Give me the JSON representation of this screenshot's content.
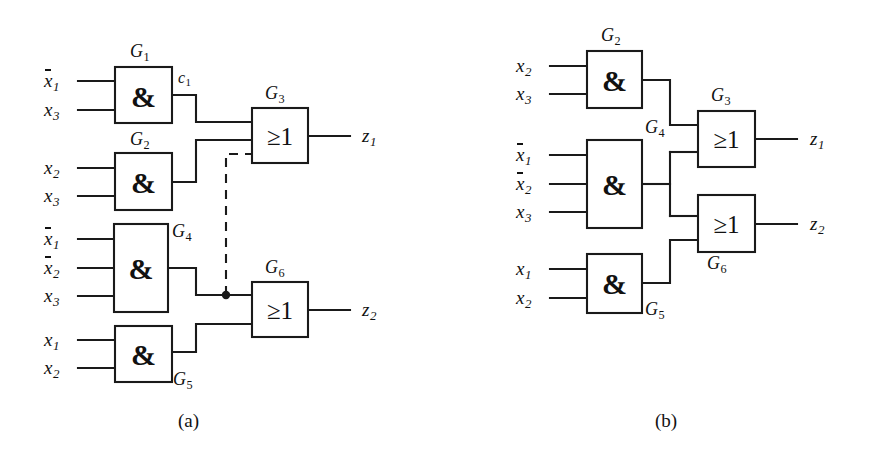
{
  "figure": {
    "type": "logic-circuit-diagram",
    "captions": [
      {
        "id": "a",
        "text": "(a)"
      },
      {
        "id": "b",
        "text": "(b)"
      }
    ]
  },
  "panel_a": {
    "caption": "(a)",
    "gates": [
      {
        "id": "G1",
        "label": "G",
        "sub": "1",
        "symbol": "&",
        "type": "AND",
        "inputs": [
          "x1bar",
          "x3"
        ],
        "output": "c1"
      },
      {
        "id": "G2",
        "label": "G",
        "sub": "2",
        "symbol": "&",
        "type": "AND",
        "inputs": [
          "x2",
          "x3"
        ]
      },
      {
        "id": "G3",
        "label": "G",
        "sub": "3",
        "symbol": "≥1",
        "type": "OR",
        "inputs": [
          "G1",
          "G2",
          "G4-dashed"
        ],
        "output": "z1"
      },
      {
        "id": "G4",
        "label": "G",
        "sub": "4",
        "symbol": "&",
        "type": "AND",
        "inputs": [
          "x1bar",
          "x2bar",
          "x3"
        ]
      },
      {
        "id": "G5",
        "label": "G",
        "sub": "5",
        "symbol": "&",
        "type": "AND",
        "inputs": [
          "x1",
          "x2"
        ]
      },
      {
        "id": "G6",
        "label": "G",
        "sub": "6",
        "symbol": "≥1",
        "type": "OR",
        "inputs": [
          "G4",
          "G5"
        ],
        "output": "z2"
      }
    ],
    "inputs": [
      {
        "id": "a-in-1",
        "base": "x",
        "sub": "1",
        "overbar": true,
        "to": "G1"
      },
      {
        "id": "a-in-2",
        "base": "x",
        "sub": "3",
        "overbar": false,
        "to": "G1"
      },
      {
        "id": "a-in-3",
        "base": "x",
        "sub": "2",
        "overbar": false,
        "to": "G2"
      },
      {
        "id": "a-in-4",
        "base": "x",
        "sub": "3",
        "overbar": false,
        "to": "G2"
      },
      {
        "id": "a-in-5",
        "base": "x",
        "sub": "1",
        "overbar": true,
        "to": "G4"
      },
      {
        "id": "a-in-6",
        "base": "x",
        "sub": "2",
        "overbar": true,
        "to": "G4"
      },
      {
        "id": "a-in-7",
        "base": "x",
        "sub": "3",
        "overbar": false,
        "to": "G4"
      },
      {
        "id": "a-in-8",
        "base": "x",
        "sub": "1",
        "overbar": false,
        "to": "G5"
      },
      {
        "id": "a-in-9",
        "base": "x",
        "sub": "2",
        "overbar": false,
        "to": "G5"
      }
    ],
    "outputs": [
      {
        "id": "a-out-1",
        "base": "z",
        "sub": "1",
        "from": "G3"
      },
      {
        "id": "a-out-2",
        "base": "z",
        "sub": "2",
        "from": "G6"
      }
    ],
    "net_labels": [
      {
        "id": "c1",
        "base": "c",
        "sub": "1",
        "at": "G1-output"
      }
    ],
    "dashed_connection": {
      "from": "G4-output-junction",
      "to": "G3-input-3",
      "style": "dashed",
      "note": "added fault/bridging connection shown dashed"
    }
  },
  "panel_b": {
    "caption": "(b)",
    "gates": [
      {
        "id": "G2",
        "label": "G",
        "sub": "2",
        "symbol": "&",
        "type": "AND",
        "inputs": [
          "x2",
          "x3"
        ]
      },
      {
        "id": "G3",
        "label": "G",
        "sub": "3",
        "symbol": "≥1",
        "type": "OR",
        "inputs": [
          "G2",
          "G4"
        ],
        "output": "z1"
      },
      {
        "id": "G4",
        "label": "G",
        "sub": "4",
        "symbol": "&",
        "type": "AND",
        "inputs": [
          "x1bar",
          "x2bar",
          "x3"
        ]
      },
      {
        "id": "G5",
        "label": "G",
        "sub": "5",
        "symbol": "&",
        "type": "AND",
        "inputs": [
          "x1",
          "x2"
        ]
      },
      {
        "id": "G6",
        "label": "G",
        "sub": "6",
        "symbol": "≥1",
        "type": "OR",
        "inputs": [
          "G4",
          "G5"
        ],
        "output": "z2"
      }
    ],
    "inputs": [
      {
        "id": "b-in-1",
        "base": "x",
        "sub": "2",
        "overbar": false,
        "to": "G2"
      },
      {
        "id": "b-in-2",
        "base": "x",
        "sub": "3",
        "overbar": false,
        "to": "G2"
      },
      {
        "id": "b-in-3",
        "base": "x",
        "sub": "1",
        "overbar": true,
        "to": "G4"
      },
      {
        "id": "b-in-4",
        "base": "x",
        "sub": "2",
        "overbar": true,
        "to": "G4"
      },
      {
        "id": "b-in-5",
        "base": "x",
        "sub": "3",
        "overbar": false,
        "to": "G4"
      },
      {
        "id": "b-in-6",
        "base": "x",
        "sub": "1",
        "overbar": false,
        "to": "G5"
      },
      {
        "id": "b-in-7",
        "base": "x",
        "sub": "2",
        "overbar": false,
        "to": "G5"
      }
    ],
    "outputs": [
      {
        "id": "b-out-1",
        "base": "z",
        "sub": "1",
        "from": "G3"
      },
      {
        "id": "b-out-2",
        "base": "z",
        "sub": "2",
        "from": "G6"
      }
    ]
  },
  "symbols": {
    "and_gate": "&",
    "or_gate": "≥1"
  },
  "colors": {
    "ink": "#1a1a1a",
    "background": "#ffffff"
  }
}
